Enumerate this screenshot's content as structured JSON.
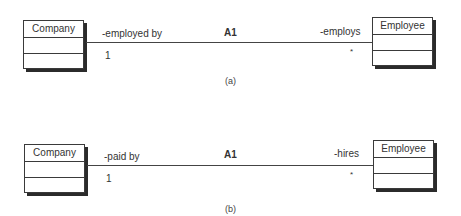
{
  "diagrams": [
    {
      "caption": "(a)",
      "association_name": "A1",
      "left_class": {
        "name": "Company",
        "role": "-employed by",
        "multiplicity": "1"
      },
      "right_class": {
        "name": "Employee",
        "role": "-employs",
        "multiplicity": "*"
      }
    },
    {
      "caption": "(b)",
      "association_name": "A1",
      "left_class": {
        "name": "Company",
        "role": "-paid by",
        "multiplicity": "1"
      },
      "right_class": {
        "name": "Employee",
        "role": "-hires",
        "multiplicity": "*"
      }
    }
  ]
}
